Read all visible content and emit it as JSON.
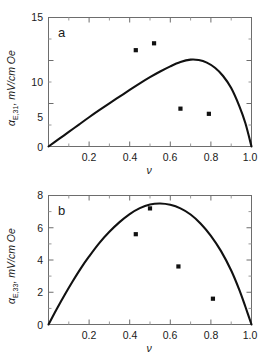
{
  "figure": {
    "background_color": "#ffffff",
    "curve_color": "#111111",
    "marker_color": "#111111",
    "axis_color": "#6d6d6d",
    "width": 271,
    "height": 356
  },
  "chart_data": [
    {
      "type": "line",
      "panel_label": "a",
      "title": "",
      "xlabel": "ν",
      "ylabel": "α",
      "ylabel_sub": "E,31",
      "ylabel_units": ", mV/cm Oe",
      "ylabel_full": "αE,31, mV/cm Oe",
      "xlim": [
        0.0,
        1.0
      ],
      "ylim": [
        0,
        15
      ],
      "xticks": [
        0.2,
        0.4,
        0.6,
        0.8,
        1.0
      ],
      "xticklabels": [
        "0.2",
        "0.4",
        "0.6",
        "0.8",
        "1.0"
      ],
      "xticks_minor": [
        0.1,
        0.3,
        0.5,
        0.7,
        0.9
      ],
      "yticks": [
        0,
        5,
        10,
        15
      ],
      "yticklabels": [
        "0",
        "5",
        "10",
        "15"
      ],
      "yticks_minor": [
        2.5,
        7.5,
        12.5
      ],
      "grid": false,
      "legend": false,
      "series": [
        {
          "name": "theory",
          "style": "solid-line",
          "x": [
            0.0,
            0.05,
            0.1,
            0.15,
            0.2,
            0.25,
            0.3,
            0.35,
            0.4,
            0.45,
            0.5,
            0.55,
            0.6,
            0.65,
            0.7,
            0.74,
            0.78,
            0.82,
            0.86,
            0.9,
            0.94,
            0.97,
            1.0
          ],
          "y": [
            0.0,
            0.85,
            1.7,
            2.55,
            3.4,
            4.22,
            5.02,
            5.8,
            6.58,
            7.34,
            8.06,
            8.72,
            9.32,
            9.82,
            10.1,
            10.05,
            9.75,
            9.15,
            8.2,
            6.8,
            4.7,
            2.7,
            0.0
          ]
        },
        {
          "name": "experiment",
          "style": "square-markers",
          "x": [
            0.43,
            0.52,
            0.65,
            0.79
          ],
          "y": [
            11.2,
            12.0,
            4.4,
            3.8
          ]
        }
      ]
    },
    {
      "type": "line",
      "panel_label": "b",
      "title": "",
      "xlabel": "ν",
      "ylabel": "α",
      "ylabel_sub": "E,33",
      "ylabel_units": ", mV/cm Oe",
      "ylabel_full": "αE,33, mV/cm Oe",
      "xlim": [
        0.0,
        1.0
      ],
      "ylim": [
        0,
        8
      ],
      "xticks": [
        0.2,
        0.4,
        0.6,
        0.8,
        1.0
      ],
      "xticklabels": [
        "0.2",
        "0.4",
        "0.6",
        "0.8",
        "1.0"
      ],
      "xticks_minor": [
        0.1,
        0.3,
        0.5,
        0.7,
        0.9
      ],
      "yticks": [
        0,
        2,
        4,
        6,
        8
      ],
      "yticklabels": [
        "0",
        "2",
        "4",
        "6",
        "8"
      ],
      "yticks_minor": [
        1,
        3,
        5,
        7
      ],
      "grid": false,
      "legend": false,
      "series": [
        {
          "name": "theory",
          "style": "solid-line",
          "x": [
            0.0,
            0.04,
            0.08,
            0.12,
            0.16,
            0.2,
            0.25,
            0.3,
            0.35,
            0.4,
            0.45,
            0.5,
            0.55,
            0.6,
            0.65,
            0.7,
            0.75,
            0.8,
            0.85,
            0.9,
            0.94,
            0.97,
            1.0
          ],
          "y": [
            0.0,
            0.95,
            1.85,
            2.7,
            3.5,
            4.22,
            5.05,
            5.75,
            6.35,
            6.85,
            7.22,
            7.44,
            7.5,
            7.42,
            7.2,
            6.82,
            6.25,
            5.5,
            4.55,
            3.35,
            2.15,
            1.1,
            0.0
          ]
        },
        {
          "name": "experiment",
          "style": "square-markers",
          "x": [
            0.43,
            0.5,
            0.64,
            0.81
          ],
          "y": [
            5.6,
            7.2,
            3.6,
            1.6
          ]
        }
      ]
    }
  ]
}
